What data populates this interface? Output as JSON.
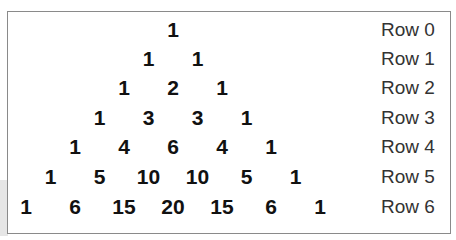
{
  "rows": [
    {
      "label": "Row 0",
      "values": [
        "1"
      ]
    },
    {
      "label": "Row 1",
      "values": [
        "1",
        "1"
      ]
    },
    {
      "label": "Row 2",
      "values": [
        "1",
        "2",
        "1"
      ]
    },
    {
      "label": "Row 3",
      "values": [
        "1",
        "3",
        "3",
        "1"
      ]
    },
    {
      "label": "Row 4",
      "values": [
        "1",
        "4",
        "6",
        "4",
        "1"
      ]
    },
    {
      "label": "Row 5",
      "values": [
        "1",
        "5",
        "10",
        "10",
        "5",
        "1"
      ]
    },
    {
      "label": "Row 6",
      "values": [
        "1",
        "6",
        "15",
        "20",
        "15",
        "6",
        "1"
      ]
    }
  ]
}
